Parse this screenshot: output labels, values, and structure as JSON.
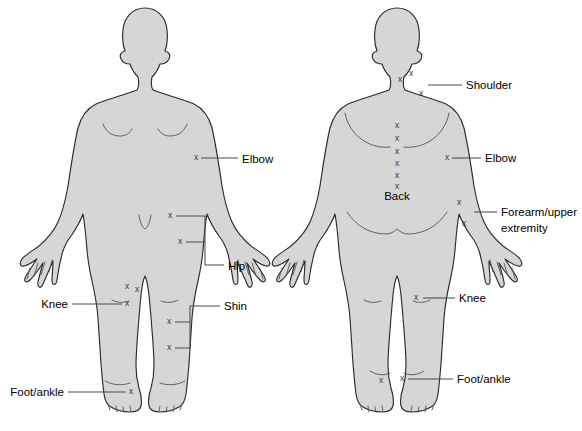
{
  "diagram": {
    "colors": {
      "body_fill": "#d6d6d6",
      "body_outline": "#2b2b2b",
      "leader_line": "#4a4a4a",
      "marker": "#3a3a3a",
      "label_text": "#000000",
      "background": "#ffffff"
    },
    "marker_glyph": "x",
    "figures": [
      {
        "name": "anterior-figure",
        "view": "front",
        "labels": [
          {
            "id": "elbow",
            "text": "Elbow",
            "x": 242,
            "y": 159,
            "align": "start",
            "lines": []
          },
          {
            "id": "hip",
            "text": "Hip",
            "x": 228,
            "y": 266,
            "align": "start",
            "lines": []
          },
          {
            "id": "knee",
            "text": "Knee",
            "x": 68,
            "y": 305,
            "align": "end",
            "lines": []
          },
          {
            "id": "shin",
            "text": "Shin",
            "x": 224,
            "y": 307,
            "align": "start",
            "lines": []
          },
          {
            "id": "foot-ankle",
            "text": "Foot/ankle",
            "x": 64,
            "y": 393,
            "align": "end",
            "lines": []
          }
        ],
        "markers": [
          {
            "site": "elbow",
            "x": 196,
            "y": 158
          },
          {
            "site": "hip",
            "x": 170,
            "y": 216
          },
          {
            "site": "hip",
            "x": 180,
            "y": 242
          },
          {
            "site": "knee",
            "x": 127,
            "y": 287
          },
          {
            "site": "knee",
            "x": 137,
            "y": 290
          },
          {
            "site": "knee",
            "x": 127,
            "y": 304
          },
          {
            "site": "shin",
            "x": 169,
            "y": 322
          },
          {
            "site": "shin",
            "x": 169,
            "y": 348
          },
          {
            "site": "foot-ankle",
            "x": 131,
            "y": 392
          }
        ]
      },
      {
        "name": "posterior-figure",
        "view": "back",
        "labels": [
          {
            "id": "shoulder",
            "text": "Shoulder",
            "x": 466,
            "y": 88,
            "align": "start",
            "lines": []
          },
          {
            "id": "elbow",
            "text": "Elbow",
            "x": 485,
            "y": 159,
            "align": "start",
            "lines": []
          },
          {
            "id": "forearm",
            "text": "Forearm/upper",
            "x": 501,
            "y": 215,
            "align": "start",
            "lines": [
              "Forearm/upper",
              "extremity"
            ]
          },
          {
            "id": "knee",
            "text": "Knee",
            "x": 459,
            "y": 298,
            "align": "start",
            "lines": []
          },
          {
            "id": "foot-ankle",
            "text": "Foot/ankle",
            "x": 457,
            "y": 378,
            "align": "start",
            "lines": []
          },
          {
            "id": "back",
            "text": "Back",
            "x": 397,
            "y": 196,
            "align": "mid",
            "lines": []
          }
        ],
        "markers": [
          {
            "site": "shoulder",
            "x": 400,
            "y": 80
          },
          {
            "site": "shoulder",
            "x": 411,
            "y": 74
          },
          {
            "site": "shoulder",
            "x": 421,
            "y": 94
          },
          {
            "site": "back",
            "x": 397,
            "y": 126
          },
          {
            "site": "back",
            "x": 397,
            "y": 139
          },
          {
            "site": "back",
            "x": 397,
            "y": 152
          },
          {
            "site": "back",
            "x": 397,
            "y": 164
          },
          {
            "site": "back",
            "x": 397,
            "y": 176
          },
          {
            "site": "back",
            "x": 397,
            "y": 187
          },
          {
            "site": "elbow",
            "x": 447,
            "y": 158
          },
          {
            "site": "forearm",
            "x": 459,
            "y": 203
          },
          {
            "site": "forearm",
            "x": 464,
            "y": 224
          },
          {
            "site": "knee",
            "x": 416,
            "y": 298
          },
          {
            "site": "foot-ankle",
            "x": 381,
            "y": 381
          },
          {
            "site": "foot-ankle",
            "x": 402,
            "y": 379
          }
        ]
      }
    ]
  }
}
